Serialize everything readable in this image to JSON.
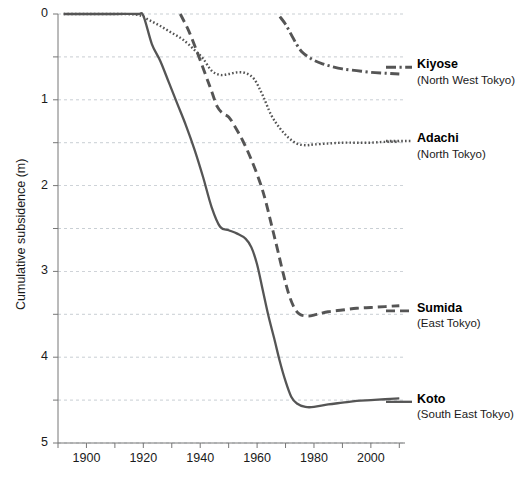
{
  "chart_data": {
    "type": "line",
    "title": "",
    "xlabel": "",
    "ylabel": "Cumulative subsidence (m)",
    "xlim": [
      1890,
      2012
    ],
    "ylim": [
      0,
      5
    ],
    "y_inverted": true,
    "grid": true,
    "grid_step": 0.5,
    "legend_position": "right-inline",
    "xticks": [
      1890,
      1900,
      1910,
      1920,
      1930,
      1940,
      1950,
      1960,
      1970,
      1980,
      1990,
      2000,
      2010
    ],
    "xtick_labels": [
      "",
      "1900",
      "",
      "1920",
      "",
      "1940",
      "",
      "1960",
      "",
      "1980",
      "",
      "2000",
      ""
    ],
    "yticks": [
      0,
      0.5,
      1,
      1.5,
      2,
      2.5,
      3,
      3.5,
      4,
      4.5,
      5
    ],
    "ytick_labels": [
      "0",
      "",
      "1",
      "",
      "2",
      "",
      "3",
      "",
      "4",
      "",
      "5"
    ],
    "line_color": "#555555",
    "grid_color": "#9aa3ad",
    "axis_color": "#777777",
    "series": [
      {
        "name": "Kiyose",
        "region": "(North West Tokyo)",
        "style": "dashdot",
        "label_y": 0.62,
        "x": [
          1968,
          1970,
          1972,
          1974,
          1976,
          1978,
          1980,
          1983,
          1986,
          1990,
          1995,
          2000,
          2005,
          2010
        ],
        "values": [
          0.03,
          0.12,
          0.24,
          0.36,
          0.45,
          0.5,
          0.54,
          0.58,
          0.61,
          0.64,
          0.66,
          0.68,
          0.69,
          0.7
        ]
      },
      {
        "name": "Adachi",
        "region": "(North Tokyo)",
        "style": "dotted",
        "label_y": 1.48,
        "x": [
          1892,
          1900,
          1910,
          1918,
          1922,
          1926,
          1930,
          1934,
          1938,
          1941,
          1944,
          1947,
          1950,
          1953,
          1956,
          1959,
          1962,
          1965,
          1968,
          1971,
          1974,
          1977,
          1980,
          1985,
          1990,
          1995,
          2000,
          2005,
          2010
        ],
        "values": [
          0.0,
          0.0,
          0.0,
          0.01,
          0.07,
          0.14,
          0.22,
          0.3,
          0.42,
          0.52,
          0.66,
          0.71,
          0.7,
          0.68,
          0.69,
          0.76,
          0.95,
          1.18,
          1.33,
          1.44,
          1.51,
          1.53,
          1.52,
          1.51,
          1.5,
          1.5,
          1.5,
          1.49,
          1.49
        ]
      },
      {
        "name": "Sumida",
        "region": "(East Tokyo)",
        "style": "dashed",
        "label_y": 3.46,
        "x": [
          1933,
          1936,
          1939,
          1942,
          1944,
          1946,
          1948,
          1950,
          1952,
          1955,
          1958,
          1961,
          1963,
          1965,
          1967,
          1969,
          1971,
          1973,
          1975,
          1978,
          1981,
          1985,
          1990,
          1995,
          2000,
          2005,
          2010
        ],
        "values": [
          0.0,
          0.2,
          0.45,
          0.72,
          0.9,
          1.08,
          1.16,
          1.2,
          1.3,
          1.48,
          1.7,
          1.96,
          2.18,
          2.45,
          2.72,
          3.0,
          3.25,
          3.42,
          3.5,
          3.52,
          3.5,
          3.47,
          3.45,
          3.43,
          3.42,
          3.41,
          3.4
        ]
      },
      {
        "name": "Koto",
        "region": "(South East Tokyo)",
        "style": "solid",
        "label_y": 4.52,
        "x": [
          1892,
          1900,
          1910,
          1918,
          1920,
          1923,
          1926,
          1929,
          1932,
          1935,
          1938,
          1941,
          1944,
          1947,
          1950,
          1953,
          1956,
          1958,
          1960,
          1962,
          1964,
          1966,
          1968,
          1970,
          1972,
          1974,
          1977,
          1980,
          1985,
          1990,
          1995,
          2000,
          2005,
          2010
        ],
        "values": [
          0.0,
          0.0,
          0.0,
          0.0,
          0.02,
          0.35,
          0.55,
          0.8,
          1.05,
          1.3,
          1.58,
          1.9,
          2.25,
          2.48,
          2.52,
          2.56,
          2.62,
          2.72,
          2.92,
          3.22,
          3.52,
          3.78,
          4.05,
          4.28,
          4.46,
          4.54,
          4.58,
          4.58,
          4.55,
          4.53,
          4.51,
          4.5,
          4.49,
          4.48
        ]
      }
    ]
  },
  "caption": ""
}
